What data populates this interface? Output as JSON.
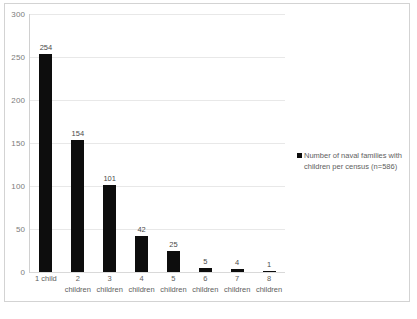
{
  "chart_data": {
    "type": "bar",
    "title": "",
    "xlabel": "",
    "ylabel": "",
    "categories": [
      "1 child",
      "2 children",
      "3 children",
      "4 children",
      "5 children",
      "6 children",
      "7 children",
      "8 children"
    ],
    "category_lines": [
      {
        "line1": "1 child",
        "line2": ""
      },
      {
        "line1": "2",
        "line2": "children"
      },
      {
        "line1": "3",
        "line2": "children"
      },
      {
        "line1": "4",
        "line2": "children"
      },
      {
        "line1": "5",
        "line2": "children"
      },
      {
        "line1": "6",
        "line2": "children"
      },
      {
        "line1": "7",
        "line2": "children"
      },
      {
        "line1": "8",
        "line2": "children"
      }
    ],
    "values": [
      254,
      154,
      101,
      42,
      25,
      5,
      4,
      1
    ],
    "data_labels": [
      "254",
      "154",
      "101",
      "42",
      "25",
      "5",
      "4",
      "1"
    ],
    "series": [
      {
        "name": "Number of naval families with children per census (n=586)",
        "values": [
          254,
          154,
          101,
          42,
          25,
          5,
          4,
          1
        ],
        "color": "#0d0d0d"
      }
    ],
    "ylim": [
      0,
      300
    ],
    "yticks": [
      0,
      50,
      100,
      150,
      200,
      250,
      300
    ],
    "ytick_labels": [
      "0",
      "50",
      "100",
      "150",
      "200",
      "250",
      "300"
    ],
    "grid": true,
    "legend_position": "right"
  },
  "legend": {
    "marker_name": "legend-color-swatch",
    "line1": "Number of naval families with",
    "line2": "children per census (n=586)",
    "full_text": "Number of naval families with children per census (n=586)"
  },
  "caption": {
    "text": ""
  },
  "colors": {
    "bar": "#0d0d0d",
    "gridline": "#e8e8e8",
    "axis": "#d0d0d0",
    "frame": "#d3d3d3",
    "tick_text": "#7b7b7b",
    "label_text": "#5e5e5e"
  }
}
